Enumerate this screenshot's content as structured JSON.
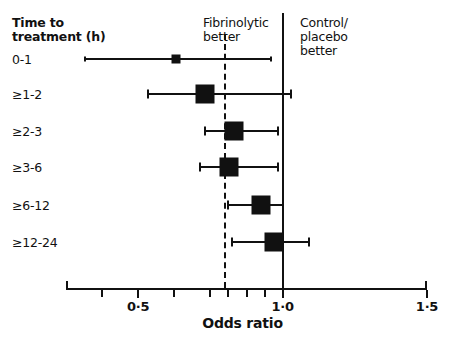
{
  "figure": {
    "background": "#ffffff",
    "ink": "#111111",
    "width": 449,
    "height": 338
  },
  "headers": {
    "row_header": "Time to\ntreatment (h)",
    "left_side": "Fibrinolytic\nbetter",
    "right_side": "Control/\nplacebo\nbetter"
  },
  "chart_data": {
    "type": "scatter",
    "subtype": "forest-plot",
    "title": "",
    "xlabel": "Odds ratio",
    "ylabel": "Time to treatment (h)",
    "xlim": [
      0.25,
      1.5
    ],
    "xticks": [
      0.5,
      1.0,
      1.5
    ],
    "xtick_labels": [
      "0·5",
      "1·0",
      "1·5"
    ],
    "minor_ticks": [
      0.375,
      0.625,
      0.75,
      0.8125,
      0.875,
      0.9375
    ],
    "grid": false,
    "legend": false,
    "reference_lines": [
      {
        "name": "pooled-estimate",
        "value": 0.8,
        "style": "dashed"
      },
      {
        "name": "null-effect",
        "value": 1.0,
        "style": "solid"
      }
    ],
    "categories": [
      "0-1",
      "≥1-2",
      "≥2-3",
      "≥3-6",
      "≥6-12",
      "≥12-24"
    ],
    "points": [
      {
        "label": "0-1",
        "odds_ratio": 0.63,
        "ci_low": 0.315,
        "ci_high": 0.96,
        "marker_size": "small"
      },
      {
        "label": "≥1-2",
        "odds_ratio": 0.73,
        "ci_low": 0.535,
        "ci_high": 1.03,
        "marker_size": "large"
      },
      {
        "label": "≥2-3",
        "odds_ratio": 0.83,
        "ci_low": 0.73,
        "ci_high": 0.985,
        "marker_size": "large"
      },
      {
        "label": "≥3-6",
        "odds_ratio": 0.815,
        "ci_low": 0.715,
        "ci_high": 0.985,
        "marker_size": "large"
      },
      {
        "label": "≥6-12",
        "odds_ratio": 0.925,
        "ci_low": 0.81,
        "ci_high": 1.0,
        "marker_size": "large"
      },
      {
        "label": "≥12-24",
        "odds_ratio": 0.97,
        "ci_low": 0.825,
        "ci_high": 1.09,
        "marker_size": "large"
      }
    ]
  },
  "caption": ""
}
